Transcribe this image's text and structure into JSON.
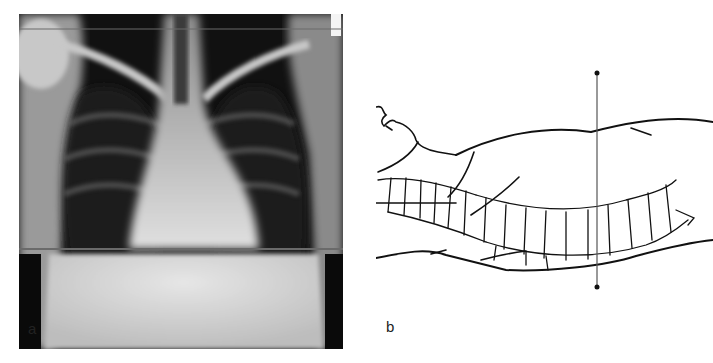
{
  "figure": {
    "panels": [
      {
        "id": "a",
        "label": "a",
        "description": "Frontal chest radiograph with horizontal reference line at diaphragm level"
      },
      {
        "id": "b",
        "label": "b",
        "description": "Line drawing of supine patient lateral view showing spine with vertical reference line"
      }
    ],
    "colors": {
      "xray_background": "#0a0a0a",
      "reference_line": "#6a6a6a",
      "drawing_stroke": "#111111"
    }
  }
}
